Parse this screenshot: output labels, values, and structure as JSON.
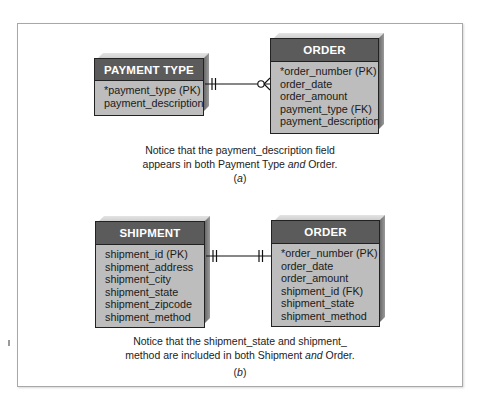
{
  "diagram_a": {
    "left_entity": {
      "title": "PAYMENT TYPE",
      "attributes": [
        "*payment_type (PK)",
        "payment_description"
      ]
    },
    "right_entity": {
      "title": "ORDER",
      "attributes": [
        "*order_number (PK)",
        "order_date",
        "order_amount",
        "payment_type (FK)",
        "payment_description"
      ]
    },
    "relationship": {
      "left_end": "one-and-only-one",
      "right_end": "zero-or-many"
    },
    "caption_line1": "Notice that the payment_description field",
    "caption_line2_pre": "appears in both Payment Type ",
    "caption_line2_em": "and",
    "caption_line2_post": " Order.",
    "label_pre": "(",
    "label_em": "a",
    "label_post": ")"
  },
  "diagram_b": {
    "left_entity": {
      "title": "SHIPMENT",
      "attributes": [
        "shipment_id (PK)",
        "shipment_address",
        "shipment_city",
        "shipment_state",
        "shipment_zipcode",
        "shipment_method"
      ]
    },
    "right_entity": {
      "title": "ORDER",
      "attributes": [
        "*order_number (PK)",
        "order_date",
        "order_amount",
        "shipment_id (FK)",
        "shipment_state",
        "shipment_method"
      ]
    },
    "relationship": {
      "left_end": "one-and-only-one",
      "right_end": "one-and-only-one"
    },
    "caption_line1": "Notice that the shipment_state and shipment_",
    "caption_line2_pre": "method are included in both Shipment ",
    "caption_line2_em": "and",
    "caption_line2_post": " Order.",
    "label_pre": "(",
    "label_em": "b",
    "label_post": ")"
  },
  "colors": {
    "header_fill": "#5b5b5b",
    "body_fill": "#bdbdbd",
    "border": "#222222",
    "frame": "#a8a8a8"
  }
}
